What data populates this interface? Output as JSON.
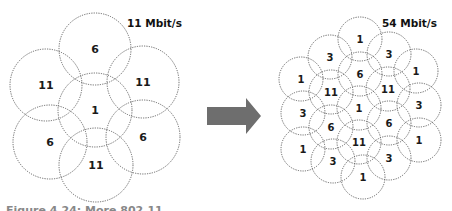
{
  "left_panel": {
    "title": "11 Mbit/s",
    "cells": [
      {
        "label": "6",
        "cx": 95,
        "cy": 49,
        "r": 36
      },
      {
        "label": "11",
        "cx": 46,
        "cy": 85,
        "r": 36
      },
      {
        "label": "11",
        "cx": 143,
        "cy": 82,
        "r": 36
      },
      {
        "label": "1",
        "cx": 95,
        "cy": 110,
        "r": 37
      },
      {
        "label": "6",
        "cx": 50,
        "cy": 142,
        "r": 37
      },
      {
        "label": "6",
        "cx": 143,
        "cy": 137,
        "r": 37
      },
      {
        "label": "11",
        "cx": 96,
        "cy": 165,
        "r": 37
      }
    ]
  },
  "arrow": {
    "color": "#6e6e6e",
    "direction": "right"
  },
  "right_panel": {
    "title": "54 Mbit/s",
    "cells": [
      {
        "label": "1",
        "cx": 360,
        "cy": 39,
        "r": 22
      },
      {
        "label": "3",
        "cx": 330,
        "cy": 57,
        "r": 22
      },
      {
        "label": "3",
        "cx": 389,
        "cy": 54,
        "r": 22
      },
      {
        "label": "6",
        "cx": 360,
        "cy": 74,
        "r": 22
      },
      {
        "label": "1",
        "cx": 301,
        "cy": 79,
        "r": 22
      },
      {
        "label": "1",
        "cx": 416,
        "cy": 71,
        "r": 22
      },
      {
        "label": "11",
        "cx": 331,
        "cy": 92,
        "r": 22
      },
      {
        "label": "11",
        "cx": 388,
        "cy": 89,
        "r": 22
      },
      {
        "label": "1",
        "cx": 359,
        "cy": 108,
        "r": 22
      },
      {
        "label": "3",
        "cx": 303,
        "cy": 113,
        "r": 22
      },
      {
        "label": "3",
        "cx": 419,
        "cy": 105,
        "r": 22
      },
      {
        "label": "6",
        "cx": 331,
        "cy": 127,
        "r": 22
      },
      {
        "label": "6",
        "cx": 389,
        "cy": 123,
        "r": 22
      },
      {
        "label": "11",
        "cx": 359,
        "cy": 142,
        "r": 22
      },
      {
        "label": "1",
        "cx": 303,
        "cy": 149,
        "r": 22
      },
      {
        "label": "1",
        "cx": 419,
        "cy": 140,
        "r": 22
      },
      {
        "label": "3",
        "cx": 333,
        "cy": 161,
        "r": 22
      },
      {
        "label": "3",
        "cx": 389,
        "cy": 158,
        "r": 22
      },
      {
        "label": "1",
        "cx": 363,
        "cy": 177,
        "r": 22
      }
    ]
  },
  "caption": "Figure 4.24: More 802.11 ..."
}
